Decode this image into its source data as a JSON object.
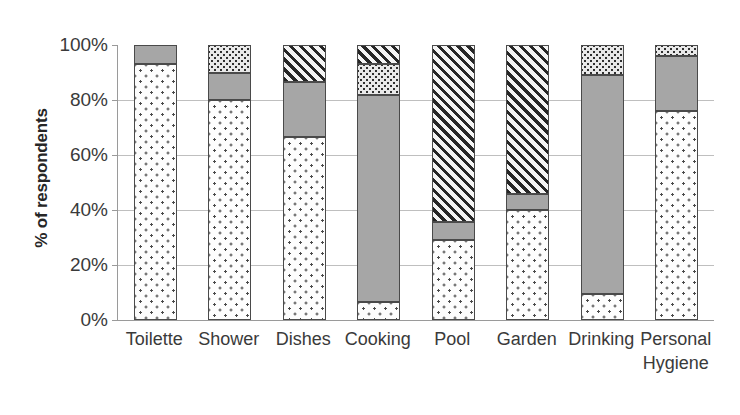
{
  "chart_data": {
    "type": "bar",
    "stacked": true,
    "title": "",
    "subtitle": "",
    "xlabel": "",
    "ylabel": "% of respondents",
    "ylim": [
      0,
      100
    ],
    "ytick_labels": [
      "0%",
      "20%",
      "40%",
      "60%",
      "80%",
      "100%"
    ],
    "ytick_values": [
      0,
      20,
      40,
      60,
      80,
      100
    ],
    "grid": true,
    "legend": "none",
    "categories": [
      "Toilette",
      "Shower",
      "Dishes",
      "Cooking",
      "Pool",
      "Garden",
      "Drinking",
      "Personal\nHygiene"
    ],
    "series": [
      {
        "name": "series-1",
        "pattern": "sparse-dots",
        "values": [
          93,
          80,
          66.5,
          6.5,
          29,
          40,
          9.5,
          76
        ]
      },
      {
        "name": "series-2",
        "pattern": "solid-gray",
        "values": [
          7,
          10,
          20,
          75.5,
          6.5,
          6,
          79.5,
          20
        ]
      },
      {
        "name": "series-3",
        "pattern": "dense-dots",
        "values": [
          0,
          10,
          0,
          11,
          0,
          0,
          11,
          4
        ]
      },
      {
        "name": "series-4",
        "pattern": "diagonal-hatch",
        "values": [
          0,
          0,
          13.5,
          7,
          64.5,
          54,
          0,
          0
        ]
      }
    ]
  },
  "colors": {
    "sparse_dots_fill": "#fdfdfd",
    "sparse_dots_ink": "#4a4a4a",
    "solid_gray": "#a6a6a6",
    "dense_dots_fill": "#e9e9e9",
    "dense_dots_ink": "#303030",
    "hatch_fill": "#f2f2f2",
    "hatch_ink": "#262626",
    "gridline": "#bfbfbf",
    "axis": "#9a9a9a",
    "text": "#3a3a3a"
  }
}
